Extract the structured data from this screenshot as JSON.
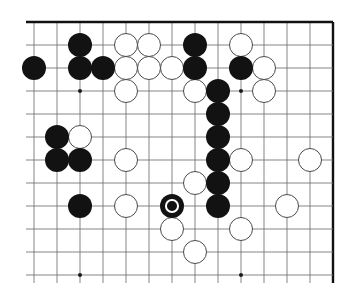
{
  "board": {
    "name": "go-board-diagram",
    "type": "go-goban",
    "geometry": {
      "origin_x": 34,
      "origin_y": 22,
      "spacing": 23.0,
      "cols": 14,
      "rows": 12,
      "stone_radius": 12.2,
      "edges": {
        "top": true,
        "right": true,
        "left": false,
        "bottom": false
      }
    },
    "colors": {
      "background": "#ffffff",
      "line": "#6f6f6f",
      "edge_line": "#111111",
      "black_stone": "#121212",
      "white_stone": "#ffffff",
      "white_stone_border": "#4a4a4a",
      "marker": "#ffffff",
      "hoshi": "#1a1a1a"
    },
    "hoshi_points": [
      {
        "col": 2,
        "row": 3
      },
      {
        "col": 9,
        "row": 3
      },
      {
        "col": 2,
        "row": 11
      },
      {
        "col": 9,
        "row": 11
      }
    ],
    "black_stones": [
      {
        "col": 0,
        "row": 2
      },
      {
        "col": 2,
        "row": 1
      },
      {
        "col": 2,
        "row": 2
      },
      {
        "col": 3,
        "row": 2
      },
      {
        "col": 7,
        "row": 1
      },
      {
        "col": 7,
        "row": 2
      },
      {
        "col": 9,
        "row": 2
      },
      {
        "col": 8,
        "row": 3
      },
      {
        "col": 1,
        "row": 5
      },
      {
        "col": 1,
        "row": 6
      },
      {
        "col": 2,
        "row": 6
      },
      {
        "col": 8,
        "row": 4
      },
      {
        "col": 8,
        "row": 5
      },
      {
        "col": 8,
        "row": 6
      },
      {
        "col": 8,
        "row": 7
      },
      {
        "col": 8,
        "row": 8
      },
      {
        "col": 2,
        "row": 8
      }
    ],
    "white_stones": [
      {
        "col": 4,
        "row": 1
      },
      {
        "col": 5,
        "row": 1
      },
      {
        "col": 9,
        "row": 1
      },
      {
        "col": 4,
        "row": 2
      },
      {
        "col": 5,
        "row": 2
      },
      {
        "col": 6,
        "row": 2
      },
      {
        "col": 10,
        "row": 2
      },
      {
        "col": 4,
        "row": 3
      },
      {
        "col": 7,
        "row": 3
      },
      {
        "col": 10,
        "row": 3
      },
      {
        "col": 2,
        "row": 5
      },
      {
        "col": 4,
        "row": 6
      },
      {
        "col": 9,
        "row": 6
      },
      {
        "col": 12,
        "row": 6
      },
      {
        "col": 7,
        "row": 7
      },
      {
        "col": 4,
        "row": 8
      },
      {
        "col": 11,
        "row": 8
      },
      {
        "col": 6,
        "row": 9
      },
      {
        "col": 9,
        "row": 9
      },
      {
        "col": 7,
        "row": 10
      }
    ],
    "marked_stones": [
      {
        "col": 6,
        "row": 8,
        "color": "black",
        "mark": "circle"
      }
    ]
  }
}
